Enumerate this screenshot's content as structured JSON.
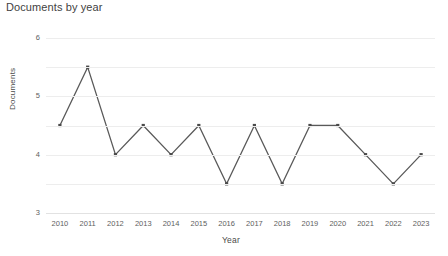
{
  "chart_data": {
    "type": "line",
    "title": "Documents by year",
    "xlabel": "Year",
    "ylabel": "Documents",
    "categories": [
      "2010",
      "2011",
      "2012",
      "2013",
      "2014",
      "2015",
      "2016",
      "2017",
      "2018",
      "2019",
      "2020",
      "2021",
      "2022",
      "2023"
    ],
    "values": [
      3,
      5,
      2,
      3,
      2,
      3,
      1,
      3,
      1,
      3,
      3,
      2,
      1,
      2
    ],
    "series": [
      {
        "name": "Documents",
        "values": [
          3,
          5,
          2,
          3,
          2,
          3,
          1,
          3,
          1,
          3,
          3,
          2,
          1,
          2
        ]
      }
    ],
    "ylim": [
      0,
      6
    ],
    "yticks": [
      "0",
      "1",
      "2",
      "3",
      "4",
      "5",
      "6"
    ],
    "ytick_values": [
      0,
      1,
      2,
      3,
      4,
      5,
      6
    ],
    "grid": true,
    "grid_axis": "y",
    "legend": false,
    "legend_position": "none",
    "marker": "square",
    "line_color": "#595959",
    "marker_color": "#4a4a4a",
    "grid_color": "#ededed",
    "background_color": "#ffffff",
    "title_color": "#3f3f3f",
    "tick_color": "#5e5e5e"
  }
}
